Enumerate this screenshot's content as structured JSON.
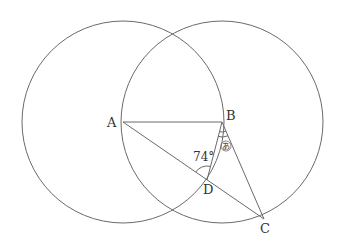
{
  "diagram": {
    "type": "geometry",
    "colors": {
      "stroke": "#6a6a6a",
      "text": "#333333",
      "background": "#ffffff"
    },
    "points": {
      "A": {
        "label": "A",
        "x": 123,
        "y": 122
      },
      "B": {
        "label": "B",
        "x": 222,
        "y": 122
      },
      "C": {
        "label": "C",
        "x": 264,
        "y": 219
      },
      "D": {
        "label": "D",
        "x": 207,
        "y": 180
      }
    },
    "circles": [
      {
        "center": "A",
        "radius": 101
      },
      {
        "center": "B",
        "radius": 101
      }
    ],
    "segments": [
      "AB",
      "AC",
      "BD",
      "BC"
    ],
    "angles": [
      {
        "vertex": "D",
        "between": [
          "A",
          "B"
        ],
        "label": "74°"
      },
      {
        "vertex": "B",
        "between": [
          "D",
          "C"
        ],
        "label": "あ"
      }
    ]
  }
}
